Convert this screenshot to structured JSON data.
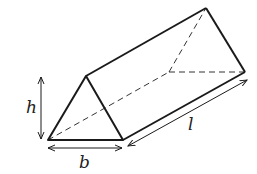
{
  "diagram": {
    "labels": {
      "height": "h",
      "base": "b",
      "length": "l"
    },
    "colors": {
      "stroke": "#1a1a1a",
      "background": "#ffffff"
    }
  }
}
